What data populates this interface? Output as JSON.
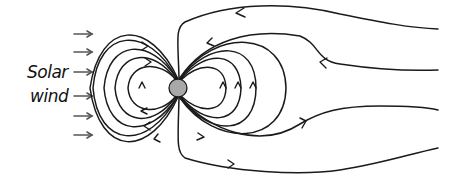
{
  "figure": {
    "labels": {
      "solar_wind_line1": "Solar",
      "solar_wind_line2": "wind"
    },
    "elements": {
      "earth": {
        "name": "Earth",
        "color": "#a8a8a8",
        "cx": 178,
        "cy": 88,
        "r": 9
      },
      "solar_wind_arrows": {
        "count": 6,
        "direction": "right",
        "color": "#555555"
      },
      "field_lines": {
        "dayside_closed_loops": 4,
        "nightside_closed_loops": 3,
        "open_tail_lines": 4,
        "line_color": "#1a1a1a"
      }
    }
  }
}
